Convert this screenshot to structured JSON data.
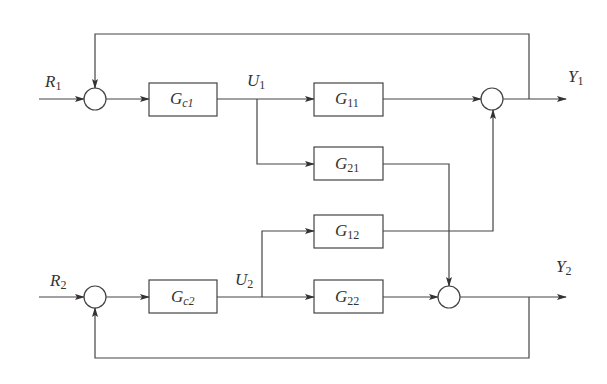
{
  "diagram": {
    "type": "block_diagram",
    "colors": {
      "line": "#444444",
      "text": "#333333",
      "background": "#ffffff"
    },
    "inputs": [
      {
        "id": "R1",
        "main": "R",
        "sub": "1"
      },
      {
        "id": "R2",
        "main": "R",
        "sub": "2"
      }
    ],
    "outputs": [
      {
        "id": "Y1",
        "main": "Y",
        "sub": "1"
      },
      {
        "id": "Y2",
        "main": "Y",
        "sub": "2"
      }
    ],
    "signals": [
      {
        "id": "U1",
        "main": "U",
        "sub": "1"
      },
      {
        "id": "U2",
        "main": "U",
        "sub": "2"
      }
    ],
    "blocks": [
      {
        "id": "Gc1",
        "main": "G",
        "sub": "c1"
      },
      {
        "id": "G11",
        "main": "G",
        "sub": "11"
      },
      {
        "id": "G21",
        "main": "G",
        "sub": "21"
      },
      {
        "id": "G12",
        "main": "G",
        "sub": "12"
      },
      {
        "id": "Gc2",
        "main": "G",
        "sub": "c2"
      },
      {
        "id": "G22",
        "main": "G",
        "sub": "22"
      }
    ],
    "summing_junctions": [
      {
        "id": "sum-R1"
      },
      {
        "id": "sum-Y1"
      },
      {
        "id": "sum-R2"
      },
      {
        "id": "sum-Y2"
      }
    ],
    "connections": [
      {
        "from": "R1",
        "to": "sum-R1"
      },
      {
        "from": "sum-R1",
        "to": "Gc1"
      },
      {
        "from": "Gc1",
        "to": "U1"
      },
      {
        "from": "U1",
        "to": "G11"
      },
      {
        "from": "U1",
        "to": "G21"
      },
      {
        "from": "G11",
        "to": "sum-Y1"
      },
      {
        "from": "G12",
        "to": "sum-Y1"
      },
      {
        "from": "sum-Y1",
        "to": "Y1"
      },
      {
        "from": "Y1",
        "to": "sum-R1",
        "type": "feedback"
      },
      {
        "from": "R2",
        "to": "sum-R2"
      },
      {
        "from": "sum-R2",
        "to": "Gc2"
      },
      {
        "from": "Gc2",
        "to": "U2"
      },
      {
        "from": "U2",
        "to": "G12"
      },
      {
        "from": "U2",
        "to": "G22"
      },
      {
        "from": "G22",
        "to": "sum-Y2"
      },
      {
        "from": "G21",
        "to": "sum-Y2"
      },
      {
        "from": "sum-Y2",
        "to": "Y2"
      },
      {
        "from": "Y2",
        "to": "sum-R2",
        "type": "feedback"
      }
    ]
  }
}
